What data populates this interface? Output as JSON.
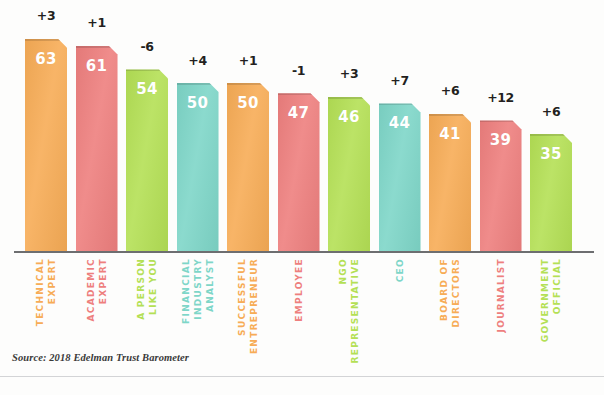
{
  "chart_data": {
    "type": "bar",
    "title": "",
    "subtitle": "",
    "xlabel": "",
    "ylabel": "",
    "ylim": [
      0,
      70
    ],
    "grid": false,
    "legend": "none",
    "orientation": "vertical",
    "source_note": "Source: 2018 Edelman Trust Barometer",
    "categories": [
      "TECHNICAL EXPERT",
      "ACADEMIC EXPERT",
      "A PERSON LIKE YOU",
      "FINANCIAL INDUSTRY ANALYST",
      "SUCCESSFUL ENTREPRENEUR",
      "EMPLOYEE",
      "NGO REPRESENTATIVE",
      "CEO",
      "BOARD OF DIRECTORS",
      "JOURNALIST",
      "GOVERNMENT OFFICIAL"
    ],
    "values": [
      63,
      61,
      54,
      50,
      50,
      47,
      46,
      44,
      41,
      39,
      35
    ],
    "deltas": [
      "+3",
      "+1",
      "-6",
      "+4",
      "+1",
      "-1",
      "+3",
      "+7",
      "+6",
      "+12",
      "+6"
    ],
    "colors": [
      "#f7ac56",
      "#ee7f7e",
      "#b4e055",
      "#7ed6c8",
      "#f7ac56",
      "#ee7f7e",
      "#b4e055",
      "#7ed6c8",
      "#f7ac56",
      "#ee7f7e",
      "#b4e055"
    ],
    "bars": [
      {
        "label": "TECHNICAL EXPERT",
        "label_lines": [
          "TECHNICAL",
          "EXPERT"
        ],
        "value": "63",
        "delta": "+3",
        "color": "#f7ac56"
      },
      {
        "label": "ACADEMIC EXPERT",
        "label_lines": [
          "ACADEMIC",
          "EXPERT"
        ],
        "value": "61",
        "delta": "+1",
        "color": "#ee7f7e"
      },
      {
        "label": "A PERSON LIKE YOU",
        "label_lines": [
          "A PERSON",
          "LIKE YOU"
        ],
        "value": "54",
        "delta": "-6",
        "color": "#b4e055"
      },
      {
        "label": "FINANCIAL INDUSTRY ANALYST",
        "label_lines": [
          "FINANCIAL",
          "INDUSTRY",
          "ANALYST"
        ],
        "value": "50",
        "delta": "+4",
        "color": "#7ed6c8"
      },
      {
        "label": "SUCCESSFUL ENTREPRENEUR",
        "label_lines": [
          "SUCCESSFUL",
          "ENTREPRENEUR"
        ],
        "value": "50",
        "delta": "+1",
        "color": "#f7ac56"
      },
      {
        "label": "EMPLOYEE",
        "label_lines": [
          "EMPLOYEE"
        ],
        "value": "47",
        "delta": "-1",
        "color": "#ee7f7e"
      },
      {
        "label": "NGO REPRESENTATIVE",
        "label_lines": [
          "NGO",
          "REPRESENTATIVE"
        ],
        "value": "46",
        "delta": "+3",
        "color": "#b4e055"
      },
      {
        "label": "CEO",
        "label_lines": [
          "CEO"
        ],
        "value": "44",
        "delta": "+7",
        "color": "#7ed6c8"
      },
      {
        "label": "BOARD OF DIRECTORS",
        "label_lines": [
          "BOARD OF",
          "DIRECTORS"
        ],
        "value": "41",
        "delta": "+6",
        "color": "#f7ac56"
      },
      {
        "label": "JOURNALIST",
        "label_lines": [
          "JOURNALIST"
        ],
        "value": "39",
        "delta": "+12",
        "color": "#ee7f7e"
      },
      {
        "label": "GOVERNMENT OFFICIAL",
        "label_lines": [
          "GOVERNMENT",
          "OFFICIAL"
        ],
        "value": "35",
        "delta": "+6",
        "color": "#b4e055"
      }
    ]
  }
}
